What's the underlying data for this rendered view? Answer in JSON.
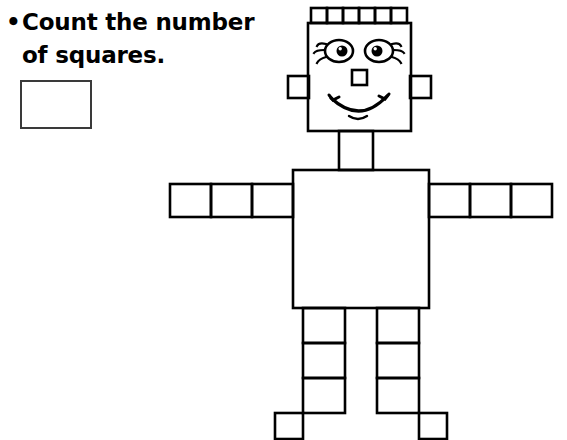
{
  "page": {
    "background_color": "#ffffff",
    "ink_color": "#000000",
    "box_border_color": "#3a3a3a",
    "width": 567,
    "height": 440
  },
  "instruction": {
    "bullet": "•",
    "line1": "Count the number",
    "line2": "of squares.",
    "full_text": "• Count the number of squares."
  },
  "answer_box": {
    "value": "",
    "placeholder": ""
  },
  "figure": {
    "name": "square-robot",
    "parts": {
      "hair_squares_count": 6,
      "head": "large-square",
      "ears_count": 2,
      "neck": "rectangle",
      "torso": "large-square",
      "left_arm_segments": 3,
      "right_arm_segments": 3,
      "left_leg_segments": 3,
      "right_leg_segments": 3,
      "feet_count": 2
    },
    "face": {
      "eyes_count": 2,
      "nose": "small-square",
      "mouth": "smile",
      "eyelashes": true
    }
  }
}
